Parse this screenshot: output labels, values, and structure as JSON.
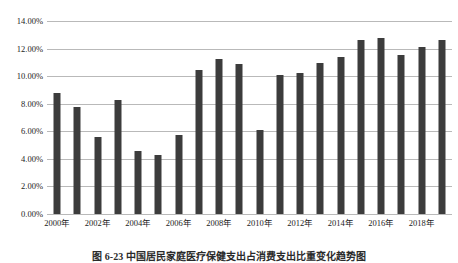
{
  "chart_data": {
    "type": "bar",
    "title": "",
    "xlabel": "",
    "ylabel": "",
    "ylim": [
      0,
      14
    ],
    "ytick_values": [
      0,
      2,
      4,
      6,
      8,
      10,
      12,
      14
    ],
    "ytick_labels": [
      "0.00%",
      "2.00%",
      "4.00%",
      "6.00%",
      "8.00%",
      "10.00%",
      "12.00%",
      "14.00%"
    ],
    "grid": true,
    "legend": "none",
    "categories": [
      "2000年",
      "2001年",
      "2002年",
      "2003年",
      "2004年",
      "2005年",
      "2006年",
      "2007年",
      "2008年",
      "2009年",
      "2010年",
      "2011年",
      "2012年",
      "2013年",
      "2014年",
      "2015年",
      "2016年",
      "2017年",
      "2018年",
      "2019年"
    ],
    "xtick_labels_shown": [
      "2000年",
      "2002年",
      "2004年",
      "2006年",
      "2008年",
      "2010年",
      "2012年",
      "2014年",
      "2016年",
      "2018年"
    ],
    "values": [
      8.8,
      7.75,
      5.6,
      8.3,
      4.55,
      4.3,
      5.7,
      10.45,
      11.25,
      10.85,
      6.1,
      10.05,
      10.2,
      10.95,
      11.4,
      12.6,
      12.8,
      11.55,
      12.1,
      12.6
    ],
    "bar_color": "#3c3c3c",
    "grid_color": "#b9b9b9",
    "background_color": "#ffffff"
  },
  "caption": {
    "text": "图 6-23  中国居民家庭医疗保健支出占消费支出比重变化趋势图"
  }
}
